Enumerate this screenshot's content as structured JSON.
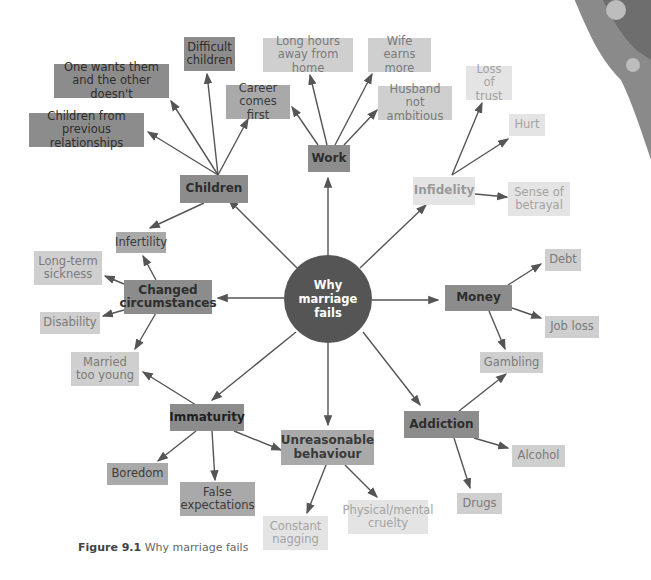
{
  "center": {
    "label": "Why\nmarriage fails"
  },
  "caption": {
    "prefix": "Figure 9.1",
    "text": " Why marriage fails"
  },
  "nodes": {
    "children": {
      "label": "Children"
    },
    "work": {
      "label": "Work"
    },
    "infidelity": {
      "label": "Infidelity"
    },
    "money": {
      "label": "Money"
    },
    "addiction": {
      "label": "Addiction"
    },
    "unreasonable": {
      "label": "Unreasonable\nbehaviour"
    },
    "immaturity": {
      "label": "Immaturity"
    },
    "changed": {
      "label": "Changed\ncircumstances"
    },
    "difficult_children": {
      "label": "Difficult\nchildren"
    },
    "one_wants": {
      "label": "One wants them\nand the other doesn't"
    },
    "prev_rel": {
      "label": "Children from\nprevious relationships"
    },
    "career": {
      "label": "Career\ncomes first"
    },
    "long_hours": {
      "label": "Long hours\naway from home"
    },
    "wife_earns": {
      "label": "Wife earns\nmore"
    },
    "husband": {
      "label": "Husband not\nambitious"
    },
    "loss_trust": {
      "label": "Loss of\ntrust"
    },
    "hurt": {
      "label": "Hurt"
    },
    "betrayal": {
      "label": "Sense of\nbetrayal"
    },
    "debt": {
      "label": "Debt"
    },
    "job_loss": {
      "label": "Job loss"
    },
    "gambling": {
      "label": "Gambling"
    },
    "alcohol": {
      "label": "Alcohol"
    },
    "drugs": {
      "label": "Drugs"
    },
    "physical": {
      "label": "Physical/mental\ncruelty"
    },
    "nagging": {
      "label": "Constant\nnagging"
    },
    "false_exp": {
      "label": "False\nexpectations"
    },
    "boredom": {
      "label": "Boredom"
    },
    "married_young": {
      "label": "Married\ntoo young"
    },
    "disability": {
      "label": "Disability"
    },
    "long_term": {
      "label": "Long-term\nsickness"
    },
    "infertility": {
      "label": "Infertility"
    }
  }
}
